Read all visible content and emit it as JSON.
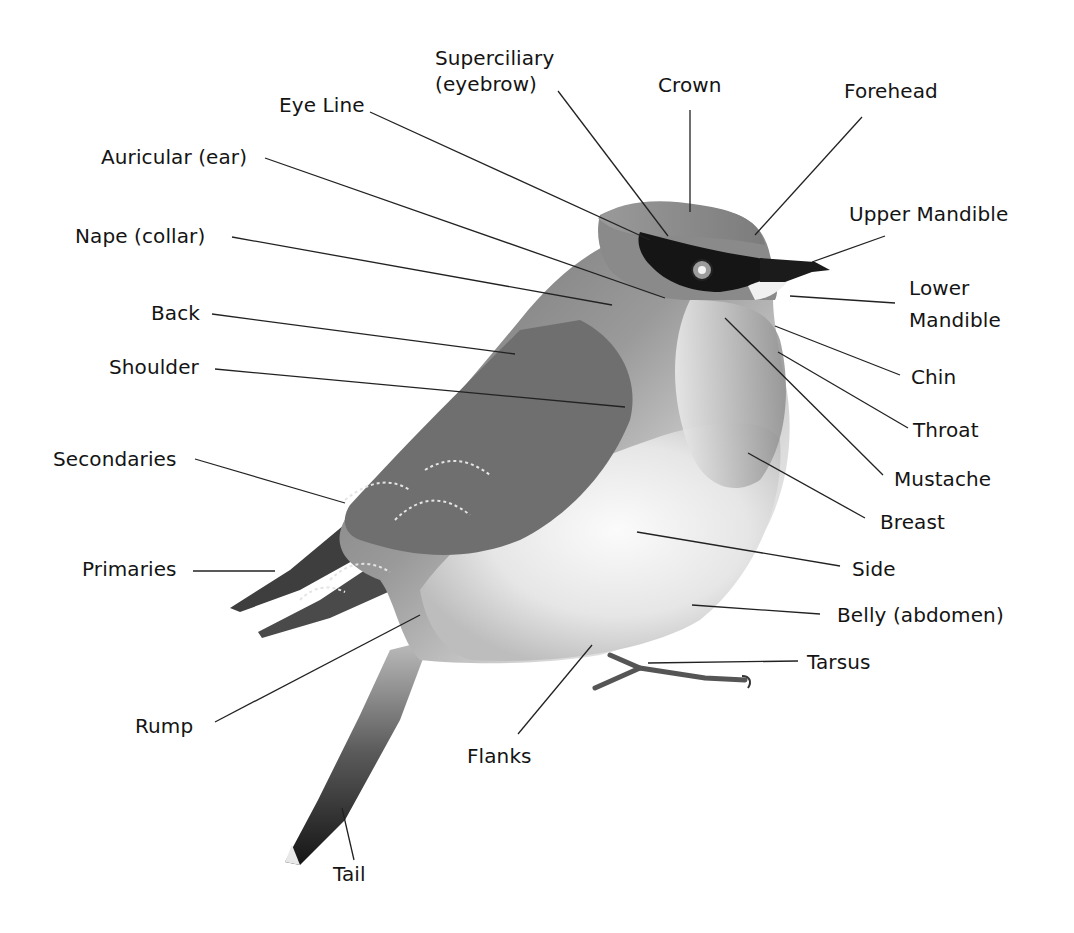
{
  "diagram": {
    "colors": {
      "background": "#ffffff",
      "text": "#141414",
      "leader": "#222222"
    },
    "labels": {
      "superciliary": {
        "line1": "Superciliary",
        "line2": "(eyebrow)"
      },
      "crown": "Crown",
      "forehead": "Forehead",
      "eye_line": "Eye Line",
      "auricular": "Auricular (ear)",
      "upper_mandible": "Upper Mandible",
      "nape": "Nape (collar)",
      "lower_mandible": {
        "line1": "Lower",
        "line2": "Mandible"
      },
      "back": "Back",
      "shoulder": "Shoulder",
      "chin": "Chin",
      "throat": "Throat",
      "secondaries": "Secondaries",
      "mustache": "Mustache",
      "breast": "Breast",
      "primaries": "Primaries",
      "side": "Side",
      "belly": "Belly (abdomen)",
      "tarsus": "Tarsus",
      "rump": "Rump",
      "flanks": "Flanks",
      "tail": "Tail"
    }
  }
}
